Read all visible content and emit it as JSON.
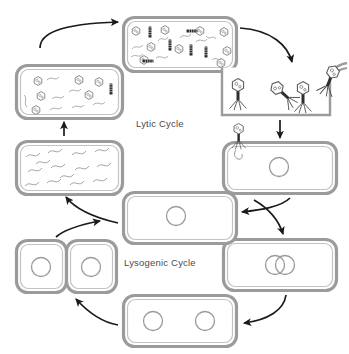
{
  "diagram": {
    "title_lytic": "Lytic Cycle",
    "title_lysogenic": "Lysogenic Cycle",
    "colors": {
      "cell_wall": "#9b9b9b",
      "cell_wall_inner": "#c9c9c9",
      "cell_fill": "#ffffff",
      "arrow": "#1a1a1a",
      "dna": "#8a8a8a",
      "phage": "#5c5c5c",
      "phage_dark": "#2e2e2e",
      "label_text": "#4a4a4a",
      "background": "#ffffff"
    },
    "stages": [
      {
        "id": "assembly-cell",
        "name": "phage-assembly-cell",
        "cycle": "lytic",
        "label": "",
        "contents": "new phage heads, tails and fragmented host DNA",
        "heads": 9,
        "tails": 6,
        "dna_strands": 8
      },
      {
        "id": "released-phages",
        "name": "released-phages-group",
        "cycle": "lytic",
        "label": "",
        "contents": "free bacteriophage virions released after lysis",
        "phages": 4
      },
      {
        "id": "attachment-cell",
        "name": "phage-attachment-cell",
        "cycle": "lytic",
        "label": "",
        "contents": "phage attached to host cell injecting DNA; host chromosome circle",
        "chromosomes": 1,
        "attached_phages": 1
      },
      {
        "id": "entry-cell",
        "name": "host-cell-with-phage-dna",
        "cycle": "shared",
        "label": "",
        "contents": "host cell with circular chromosome; decision point",
        "chromosomes": 1
      },
      {
        "id": "integration-cell",
        "name": "prophage-integration-cell",
        "cycle": "lysogenic",
        "label": "",
        "contents": "phage DNA integrated into host chromosome (two overlapping circles)",
        "chromosomes": 2
      },
      {
        "id": "replication-cell",
        "name": "chromosome-replication-cell",
        "cycle": "lysogenic",
        "label": "",
        "contents": "cell with two replicated chromosomes before division",
        "chromosomes": 2
      },
      {
        "id": "divided-cells",
        "name": "divided-daughter-cells",
        "cycle": "lysogenic",
        "label": "",
        "contents": "two daughter cells each carrying a prophage",
        "cells": 2,
        "chromosomes_per_cell": 1
      },
      {
        "id": "dna-degradation-cell",
        "name": "host-dna-degradation-cell",
        "cycle": "lytic",
        "label": "",
        "contents": "host DNA degraded into many squiggly fragments",
        "dna_strands": 14
      },
      {
        "id": "synthesis-cell",
        "name": "phage-component-synthesis-cell",
        "cycle": "lytic",
        "label": "",
        "contents": "phage heads, a tail and DNA strands being synthesised",
        "heads": 6,
        "tails": 1,
        "dna_strands": 7
      }
    ],
    "arrows": [
      {
        "id": "a1",
        "name": "arrow-synthesis-to-assembly",
        "from": "synthesis-cell",
        "to": "assembly-cell",
        "style": "curved"
      },
      {
        "id": "a2",
        "name": "arrow-assembly-to-release",
        "from": "assembly-cell",
        "to": "released-phages",
        "style": "curved"
      },
      {
        "id": "a3",
        "name": "arrow-release-to-attachment",
        "from": "released-phages",
        "to": "attachment-cell",
        "style": "straight"
      },
      {
        "id": "a4",
        "name": "arrow-attachment-to-entry",
        "from": "attachment-cell",
        "to": "entry-cell",
        "style": "curved"
      },
      {
        "id": "a5",
        "name": "arrow-attachment-to-integration",
        "from": "attachment-cell",
        "to": "integration-cell",
        "style": "curved"
      },
      {
        "id": "a6",
        "name": "arrow-integration-to-replication",
        "from": "integration-cell",
        "to": "replication-cell",
        "style": "curved"
      },
      {
        "id": "a7",
        "name": "arrow-replication-to-division",
        "from": "replication-cell",
        "to": "divided-cells",
        "style": "curved"
      },
      {
        "id": "a8",
        "name": "arrow-division-to-entry",
        "from": "divided-cells",
        "to": "entry-cell",
        "style": "curved"
      },
      {
        "id": "a9",
        "name": "arrow-entry-to-degradation",
        "from": "entry-cell",
        "to": "dna-degradation-cell",
        "style": "curved"
      },
      {
        "id": "a10",
        "name": "arrow-degradation-to-synthesis",
        "from": "dna-degradation-cell",
        "to": "synthesis-cell",
        "style": "straight"
      }
    ]
  }
}
